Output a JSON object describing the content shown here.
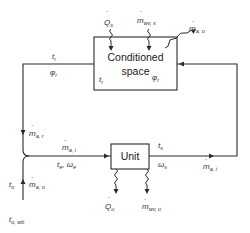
{
  "diagram": {
    "type": "air-conditioning system schematic",
    "components": {
      "conditioned_space": {
        "line1": "Conditioned",
        "line2": "space"
      },
      "unit": {
        "label": "Unit"
      }
    },
    "labels": {
      "Q_s": {
        "main": "Q",
        "sub": "s"
      },
      "m_wv_s": {
        "main": "m",
        "sub": "wv, s"
      },
      "m_a_o_top": {
        "main": "m",
        "sub": "a, o"
      },
      "t_r_left": {
        "main": "t",
        "sub": "r"
      },
      "phi_r_left": {
        "main": "φ",
        "sub": "r"
      },
      "t_r_box": {
        "main": "t",
        "sub": "r"
      },
      "phi_r_box": {
        "main": "φ",
        "sub": "r"
      },
      "m_a_r": {
        "main": "m",
        "sub": "a, r"
      },
      "m_a_i_in": {
        "main": "m",
        "sub": "a, i"
      },
      "t_e_omega_e": {
        "main": "t",
        "sub": "e",
        "sep": ", ω",
        "sub2": "e"
      },
      "t_s": {
        "main": "t",
        "sub": "s"
      },
      "omega_s": {
        "main": "ω",
        "sub": "s"
      },
      "m_a_i_out": {
        "main": "m",
        "sub": "a, i"
      },
      "t_o": {
        "main": "t",
        "sub": "o"
      },
      "m_a_o_bottom": {
        "main": "m",
        "sub": "a, o"
      },
      "t_o_wb": {
        "main": "t",
        "sub": "o, wb"
      },
      "Q_u": {
        "main": "Q",
        "sub": "u"
      },
      "m_wv_u": {
        "main": "m",
        "sub": "wv, u"
      }
    },
    "dot_symbol": "·",
    "colors": {
      "stroke": "#2a2a2a",
      "text": "#333333",
      "background": "#ffffff"
    }
  }
}
